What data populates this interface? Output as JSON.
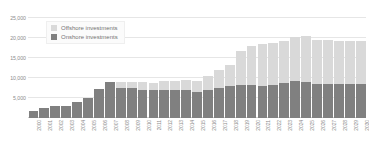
{
  "chart_data": {
    "type": "bar",
    "stacked": true,
    "title": "",
    "xlabel": "",
    "ylabel": "",
    "ylim": [
      0,
      27500
    ],
    "yticks": [
      5000,
      10000,
      15000,
      20000,
      25000
    ],
    "ytick_labels": [
      "5,000",
      "10,000",
      "15,000",
      "20,000",
      "25,000"
    ],
    "grid": true,
    "legend_position": "top-left-inside",
    "categories": [
      "2000",
      "2001",
      "2002",
      "2003",
      "2004",
      "2005",
      "2006",
      "2007",
      "2008",
      "2009",
      "2010",
      "2011",
      "2012",
      "2013",
      "2014",
      "2015",
      "2016",
      "2017",
      "2018",
      "2019",
      "2020",
      "2021",
      "2022",
      "2023",
      "2024",
      "2025",
      "2026",
      "2027",
      "2028",
      "2029",
      "2030"
    ],
    "series": [
      {
        "name": "Onshore investments",
        "color": "#808080",
        "values": [
          1700,
          2500,
          3100,
          3100,
          3900,
          5100,
          7300,
          8900,
          7600,
          7500,
          7000,
          7000,
          7100,
          7100,
          7100,
          6600,
          7000,
          7600,
          7900,
          8300,
          8300,
          8000,
          8200,
          8800,
          9200,
          9100,
          8500,
          8500,
          8500,
          8500,
          8600
        ]
      },
      {
        "name": "Offshore investments",
        "color": "#d9d9d9",
        "values": [
          0,
          0,
          0,
          0,
          0,
          0,
          0,
          0,
          1300,
          1400,
          2000,
          1700,
          2100,
          2200,
          2300,
          2600,
          3400,
          4500,
          5300,
          8400,
          9700,
          10500,
          10500,
          10400,
          11000,
          11400,
          11000,
          10900,
          10800,
          10800,
          10700
        ]
      }
    ]
  },
  "legend": {
    "items": [
      {
        "label": "Offshore investments",
        "color": "#d9d9d9"
      },
      {
        "label": "Onshore investments",
        "color": "#808080"
      }
    ]
  }
}
